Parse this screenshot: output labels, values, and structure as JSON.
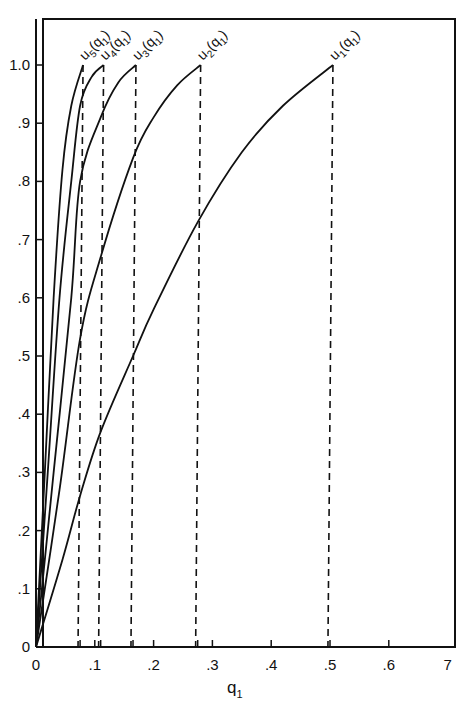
{
  "chart_data": {
    "type": "line",
    "title": "",
    "xlabel": "q1",
    "ylabel": "",
    "xlim": [
      0,
      0.7
    ],
    "ylim": [
      0,
      1.05
    ],
    "grid": false,
    "legend": "none (curves labeled inline at their endpoints)",
    "x_tick_labels": [
      "0",
      ".1",
      ".2",
      ".3",
      ".4",
      ".5",
      ".6",
      "7"
    ],
    "x_tick_values": [
      0,
      0.1,
      0.2,
      0.3,
      0.4,
      0.5,
      0.6,
      0.7
    ],
    "y_tick_labels": [
      "0",
      ".1",
      ".2",
      ".3",
      ".4",
      ".5",
      ".6",
      ".7",
      ".8",
      ".9",
      "1.0"
    ],
    "y_tick_values": [
      0,
      0.1,
      0.2,
      0.3,
      0.4,
      0.5,
      0.6,
      0.7,
      0.8,
      0.9,
      1.0
    ],
    "extra_x_ticks_at_dashed_lines": [
      0.075,
      0.11,
      0.165,
      0.275
    ],
    "series": [
      {
        "name": "u1(q1)",
        "label_main": "u",
        "label_sub": "1",
        "label_arg": "(q",
        "label_arg_sub": "1",
        "end_x": 0.505,
        "points": [
          [
            0,
            0
          ],
          [
            0.045,
            0.15
          ],
          [
            0.075,
            0.26
          ],
          [
            0.11,
            0.37
          ],
          [
            0.165,
            0.5
          ],
          [
            0.2,
            0.58
          ],
          [
            0.275,
            0.73
          ],
          [
            0.35,
            0.85
          ],
          [
            0.42,
            0.93
          ],
          [
            0.505,
            1.0
          ]
        ]
      },
      {
        "name": "u2(q1)",
        "label_main": "u",
        "label_sub": "2",
        "label_arg": "(q",
        "label_arg_sub": "1",
        "end_x": 0.28,
        "points": [
          [
            0,
            0
          ],
          [
            0.04,
            0.27
          ],
          [
            0.075,
            0.53
          ],
          [
            0.11,
            0.67
          ],
          [
            0.165,
            0.84
          ],
          [
            0.2,
            0.91
          ],
          [
            0.24,
            0.965
          ],
          [
            0.28,
            1.0
          ]
        ]
      },
      {
        "name": "u3(q1)",
        "label_main": "u",
        "label_sub": "3",
        "label_arg": "(q",
        "label_arg_sub": "1",
        "end_x": 0.17,
        "points": [
          [
            0,
            0
          ],
          [
            0.03,
            0.3
          ],
          [
            0.06,
            0.6
          ],
          [
            0.075,
            0.8
          ],
          [
            0.11,
            0.91
          ],
          [
            0.14,
            0.97
          ],
          [
            0.17,
            1.0
          ]
        ]
      },
      {
        "name": "u4(q1)",
        "label_main": "u",
        "label_sub": "4",
        "label_arg": "(q",
        "label_arg_sub": "1",
        "end_x": 0.115,
        "points": [
          [
            0,
            0
          ],
          [
            0.02,
            0.3
          ],
          [
            0.04,
            0.6
          ],
          [
            0.06,
            0.8
          ],
          [
            0.075,
            0.93
          ],
          [
            0.095,
            0.98
          ],
          [
            0.115,
            1.0
          ]
        ]
      },
      {
        "name": "u5(q1)",
        "label_main": "u",
        "label_sub": "5",
        "label_arg": "(q",
        "label_arg_sub": "1",
        "end_x": 0.08,
        "points": [
          [
            0,
            0
          ],
          [
            0.015,
            0.3
          ],
          [
            0.03,
            0.6
          ],
          [
            0.045,
            0.82
          ],
          [
            0.06,
            0.93
          ],
          [
            0.08,
            1.0
          ]
        ]
      }
    ],
    "annotations": [
      "Vertical dashed lines drop from the endpoint of each curve u1..u5 to the q1 axis",
      "All curves start at origin (0,0) and end at u = 1.0"
    ]
  },
  "axes": {
    "x_title": "q",
    "x_title_sub": "1"
  }
}
